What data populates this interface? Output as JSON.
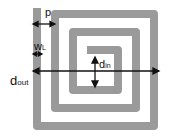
{
  "diagram": {
    "colors": {
      "track": "#9a9a9a",
      "arrow": "#111111",
      "background": "#ffffff"
    },
    "labels": {
      "p": {
        "main": "p",
        "sub": ""
      },
      "wl": {
        "main": "w",
        "sub": "L"
      },
      "din": {
        "main": "d",
        "sub": "in"
      },
      "dout": {
        "main": "d",
        "sub": "out"
      }
    }
  }
}
